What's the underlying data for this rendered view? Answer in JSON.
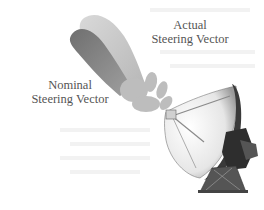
{
  "diagram": {
    "labels": {
      "actual": {
        "line1": "Actual",
        "line2": "Steering Vector"
      },
      "nominal": {
        "line1": "Nominal",
        "line2": "Steering Vector"
      }
    },
    "elements": {
      "antenna": "satellite-dish-antenna",
      "nominal_beam": "nominal-beam-lobe",
      "actual_beam": "actual-beam-lobe"
    },
    "colors": {
      "background": "#ffffff",
      "label_text": "#555555",
      "nominal_beam": "#8e8e8e",
      "actual_beam": "#c4c4c4",
      "dish_face": "#efefef",
      "dish_dark": "#3a3a3a"
    }
  }
}
